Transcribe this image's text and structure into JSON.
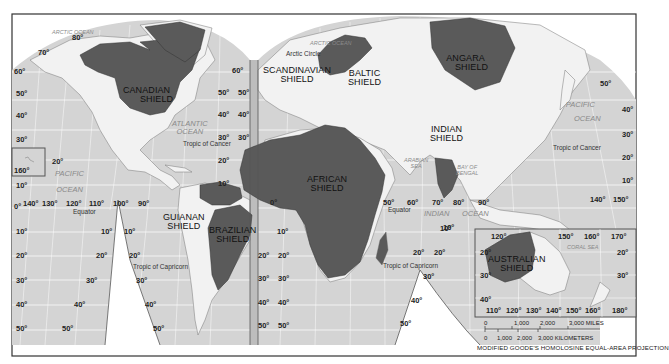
{
  "map": {
    "projection_label": "MODIFIED GOODE'S HOMOLOSINE EQUAL-AREA PROJECTION",
    "colors": {
      "ocean": "#d4d4d4",
      "land": "#f2f2f2",
      "shield": "#5a5a5a",
      "graticule": "#ffffff",
      "border": "#333333"
    },
    "shields": [
      {
        "id": "canadian",
        "line1": "CANADIAN",
        "line2": "SHIELD"
      },
      {
        "id": "scandinavian",
        "line1": "SCANDINAVIAN",
        "line2": "SHIELD"
      },
      {
        "id": "baltic",
        "line1": "BALTIC",
        "line2": "SHIELD"
      },
      {
        "id": "angara",
        "line1": "ANGARA",
        "line2": "SHIELD"
      },
      {
        "id": "indian",
        "line1": "INDIAN",
        "line2": "SHIELD"
      },
      {
        "id": "african",
        "line1": "AFRICAN",
        "line2": "SHIELD"
      },
      {
        "id": "guianan",
        "line1": "GUIANAN",
        "line2": "SHIELD"
      },
      {
        "id": "brazilian",
        "line1": "BRAZILIAN",
        "line2": "SHIELD"
      },
      {
        "id": "australian",
        "line1": "AUSTRALIAN",
        "line2": "SHIELD"
      }
    ],
    "water_bodies": {
      "arctic_ocean_west": "ARCTIC OCEAN",
      "arctic_ocean_east": "ARCTIC OCEAN",
      "atlantic_l1": "ATLANTIC",
      "atlantic_l2": "OCEAN",
      "pacific_west_l1": "PACIFIC",
      "pacific_west_l2": "OCEAN",
      "pacific_east_l1": "PACIFIC",
      "pacific_east_l2": "OCEAN",
      "indian_l1": "INDIAN",
      "indian_l2": "OCEAN",
      "arabian_l1": "ARABIAN",
      "arabian_l2": "SEA",
      "bengal_l1": "BAY OF",
      "bengal_l2": "BENGAL",
      "coral_sea": "CORAL SEA"
    },
    "lines": {
      "arctic_circle": "Arctic Circle",
      "tropic_cancer": "Tropic of Cancer",
      "tropic_cancer_east": "Tropic of Cancer",
      "equator_west": "Equator",
      "equator_east": "Equator",
      "tropic_capricorn_west": "Tropic of Capricorn",
      "tropic_capricorn_east": "Tropic of Capricorn"
    },
    "latitude_labels": {
      "l80": "80°",
      "l70": "70°",
      "l60": "60°",
      "l50": "50°",
      "l40": "40°",
      "l30": "30°",
      "l20": "20°",
      "l10": "10°",
      "l0": "0°",
      "l160": "160°"
    },
    "longitude_labels_west": [
      "140°",
      "130°",
      "120°",
      "110°",
      "100°",
      "90°"
    ],
    "longitude_labels_east": [
      "50°",
      "60°",
      "70°",
      "80°",
      "90°"
    ],
    "longitude_labels_pacific": [
      "140°",
      "150°"
    ],
    "australia_inset": {
      "top_labels": [
        "120°",
        "150°",
        "160°",
        "170°"
      ],
      "bottom_labels": [
        "110°",
        "120°",
        "130°",
        "140°",
        "150°",
        "160°",
        "180°"
      ],
      "left_labels": [
        "20°",
        "30°",
        "40°"
      ],
      "right_labels": [
        "20°",
        "30°"
      ]
    },
    "scale_bar": {
      "miles_labels": [
        "0",
        "1,000",
        "2,000",
        "3,000 MILES"
      ],
      "km_labels": [
        "0",
        "1,000",
        "2,000",
        "3,000 KILOMETERS"
      ]
    }
  }
}
